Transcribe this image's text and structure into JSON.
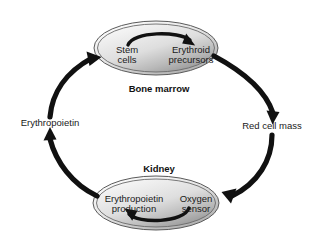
{
  "diagram": {
    "background_color": "#ffffff",
    "compartments": [
      {
        "id": "bone-marrow",
        "label": "Bone marrow",
        "nodes": [
          {
            "id": "stem-cells",
            "line1": "Stem",
            "line2": "cells"
          },
          {
            "id": "erythroid-precursors",
            "line1": "Erythroid",
            "line2": "precursors"
          }
        ]
      },
      {
        "id": "kidney",
        "label": "Kidney",
        "nodes": [
          {
            "id": "erythropoietin-production",
            "line1": "Erythropoietin",
            "line2": "production"
          },
          {
            "id": "oxygen-sensor",
            "line1": "Oxygen",
            "line2": "sensor"
          }
        ]
      }
    ],
    "edge_labels": [
      {
        "id": "red-cell-mass",
        "text": "Red cell mass"
      },
      {
        "id": "erythropoietin",
        "text": "Erythropoietin"
      }
    ],
    "colors": {
      "arrow": "#111111",
      "ellipse_stroke": "#4d4d4d",
      "ellipse_fill_light": "#f2f2f2",
      "ellipse_fill_dark": "#9a9a9a",
      "text": "#1a1a1a"
    }
  }
}
